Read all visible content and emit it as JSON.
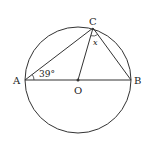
{
  "diagram": {
    "type": "geometry-circle",
    "points": {
      "A": {
        "label": "A",
        "x": 25,
        "y": 80
      },
      "B": {
        "label": "B",
        "x": 131,
        "y": 80
      },
      "C": {
        "label": "C",
        "x": 93,
        "y": 28
      },
      "O": {
        "label": "O",
        "x": 78,
        "y": 80
      }
    },
    "circle": {
      "cx": 78,
      "cy": 80,
      "r": 53
    },
    "angles": {
      "angle_A": {
        "label": "39°",
        "vertex": "A"
      },
      "angle_C": {
        "label": "x",
        "vertex": "C"
      }
    },
    "colors": {
      "stroke": "#333333",
      "background": "#ffffff"
    }
  }
}
